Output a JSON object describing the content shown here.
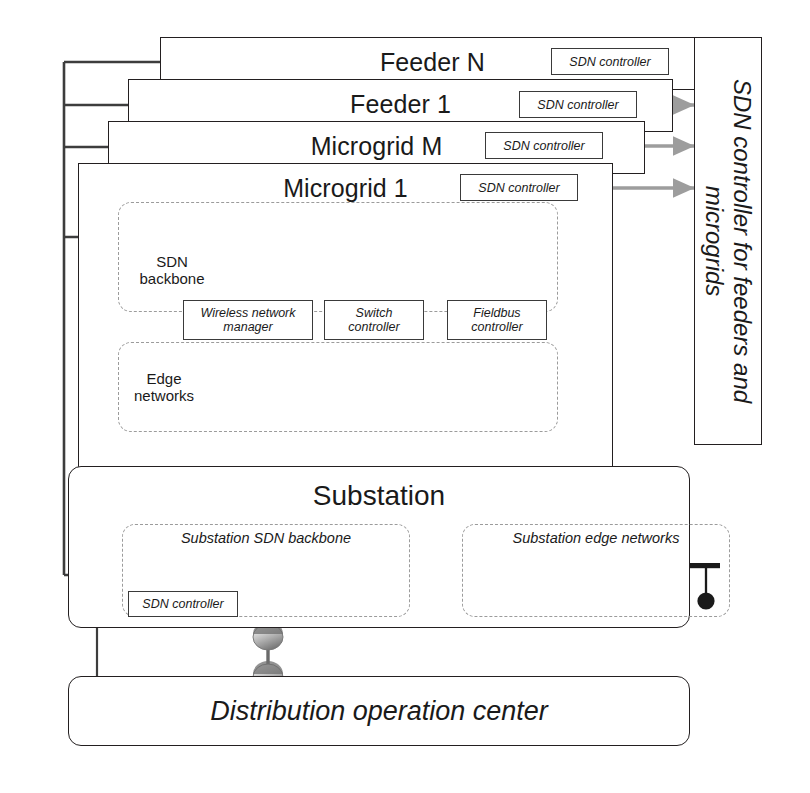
{
  "diagram": {
    "colors": {
      "line": "#231f20",
      "arrow_gray": "#9d9d9d",
      "dash_gray": "#9b9b9b",
      "switch_gray": "#b9b9b9",
      "node_black": "#1a1a1a",
      "link_dark": "#4a4a4a",
      "background": "#ffffff"
    },
    "layers": [
      {
        "id": "feeder-n",
        "title": "Feeder N",
        "controller": "SDN controller"
      },
      {
        "id": "feeder-1",
        "title": "Feeder 1",
        "controller": "SDN controller"
      },
      {
        "id": "microgrid-m",
        "title": "Microgrid M",
        "controller": "SDN controller"
      },
      {
        "id": "microgrid-1",
        "title": "Microgrid 1",
        "controller": "SDN controller"
      }
    ],
    "microgrid_1": {
      "backbone_label": "SDN\nbackbone",
      "backbone_label_line1": "SDN",
      "backbone_label_line2": "backbone",
      "edge_label_line1": "Edge",
      "edge_label_line2": "networks",
      "mid_controllers": [
        {
          "id": "wireless-network-manager",
          "line1": "Wireless network",
          "line2": "manager"
        },
        {
          "id": "switch-controller",
          "line1": "Switch",
          "line2": "controller"
        },
        {
          "id": "fieldbus-controller",
          "line1": "Fieldbus",
          "line2": "controller"
        }
      ],
      "edge_topologies": [
        {
          "id": "wireless-mesh-cloud",
          "kind": "mesh-cloud",
          "nodes": 5
        },
        {
          "id": "star-network",
          "kind": "star",
          "nodes": 5
        },
        {
          "id": "fieldbus-network",
          "kind": "bus",
          "nodes": 3
        }
      ],
      "backbone_switches": 6,
      "backbone_hosts": 5
    },
    "substation": {
      "title": "Substation",
      "backbone_region_label": "Substation SDN backbone",
      "edge_region_label": "Substation edge networks",
      "controller": "SDN controller",
      "backbone_switches": 4,
      "edge_topologies": [
        {
          "id": "substation-wireless-mesh-cloud",
          "kind": "mesh-cloud",
          "nodes": 5
        },
        {
          "id": "substation-star-network",
          "kind": "star",
          "nodes": 5
        },
        {
          "id": "substation-fieldbus-network",
          "kind": "bus",
          "nodes": 3
        }
      ]
    },
    "distribution_operation_center": {
      "title": "Distribution operation center"
    },
    "right_panel": {
      "label": "SDN controller for feeders and microgrids",
      "label_line1": "SDN controller for feeders and",
      "label_line2": "microgrids",
      "arrow_count": 4
    }
  }
}
